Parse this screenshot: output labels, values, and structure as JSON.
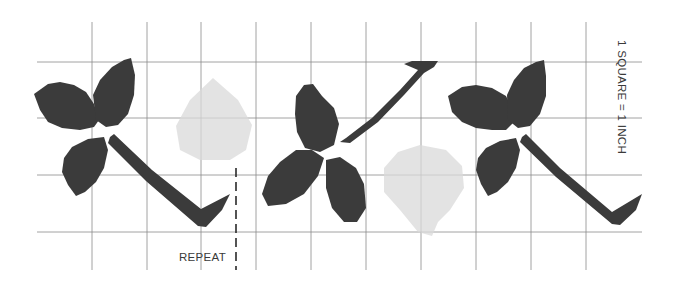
{
  "diagram": {
    "scale_label": "1 SQUARE = 1 INCH",
    "repeat_label": "REPEAT",
    "colors": {
      "leaf": "#3b3b3b",
      "berry": "#d9d9d9",
      "grid": "#8a8a8a",
      "text": "#3a3a3a"
    },
    "grid": {
      "vertical_x": [
        92,
        147,
        201,
        256,
        311,
        366,
        421,
        476,
        531,
        586
      ],
      "vertical_y_range": [
        22,
        270
      ],
      "horizontal_y": [
        62,
        118,
        175,
        232
      ],
      "horizontal_x_range": [
        37,
        642
      ]
    },
    "repeat_marker": {
      "x": 236,
      "y1": 168,
      "y2": 270,
      "label_x": 179,
      "label_y": 261
    },
    "scale_label_position": {
      "x": 618,
      "y": 40,
      "rotation": 90
    },
    "motifs": [
      {
        "name": "leaf-cluster-left",
        "leaves": [
          "M34,94 L48,84 L60,82 L74,85 L86,92 L94,104 L99,120 L94,127 L80,130 L62,128 L48,122 L40,110 Z",
          "M93,95 L100,80 L112,67 L124,60 L131,58 L135,75 L134,95 L128,114 L118,125 L106,127 L96,120 Z",
          "M64,158 L72,147 L88,139 L104,137 L108,150 L104,168 L96,182 L85,192 L76,196 L68,185 L62,172 Z"
        ],
        "stem": "M110,137 L114,134 L152,170 L201,209 L230,194 L222,210 L206,227 L198,226 L146,181 L108,143 Z",
        "berry": {
          "cx": 213,
          "cy": 120,
          "rx": 39,
          "ry": 40,
          "points": "M213,78 L238,100 L252,125 L246,150 L230,160 L200,160 L180,150 L176,126 L190,100 Z"
        }
      },
      {
        "name": "leaf-cluster-middle",
        "leaves": [
          "M296,96 L304,85 L313,84 L322,96 L334,108 L339,124 L334,145 L320,152 L305,148 L297,132 L295,114 Z",
          "M262,194 L268,176 L280,162 L296,150 L312,150 L324,158 L318,176 L304,194 L286,204 L268,206 Z",
          "M326,160 L340,157 L356,168 L364,184 L366,208 L357,222 L344,222 L332,208 L326,188 Z"
        ],
        "stem": "M340,142 L346,138 L372,118 L400,90 L418,70 L404,64 L412,61 L438,61 L434,67 L424,73 L404,95 L378,122 L350,143 Z",
        "berry": {
          "cx": 422,
          "cy": 187,
          "rx": 42,
          "ry": 44,
          "points": "M420,145 L446,150 L462,166 L464,188 L450,210 L438,222 L432,236 L418,232 L400,210 L384,192 L384,168 L398,152 Z"
        }
      },
      {
        "name": "leaf-cluster-right",
        "leaves": [
          "M448,96 L462,87 L476,85 L492,88 L506,96 L512,108 L514,122 L506,130 L492,130 L476,128 L462,122 L452,112 Z",
          "M507,95 L514,80 L524,68 L536,62 L544,60 L546,76 L546,96 L540,114 L530,126 L518,128 L508,120 Z",
          "M478,158 L486,148 L500,141 L516,138 L520,150 L516,168 L508,182 L497,192 L488,196 L481,184 L476,170 Z"
        ],
        "stem": "M522,137 L526,134 L560,168 L612,212 L642,194 L636,210 L620,225 L612,224 L556,177 L520,142 Z"
      }
    ]
  }
}
